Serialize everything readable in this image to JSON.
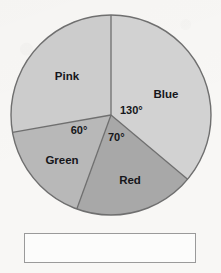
{
  "chart_data": {
    "type": "pie",
    "title": "",
    "categories": [
      "Blue",
      "Red",
      "Green",
      "Pink"
    ],
    "values": [
      130,
      70,
      60,
      100
    ],
    "value_unit": "degrees",
    "total_degrees": 360,
    "start_angle_deg": 0,
    "direction": "clockwise",
    "labels_shown": [
      "Blue",
      "Red",
      "Green",
      "Pink"
    ],
    "angle_annotations": [
      "130°",
      "70°",
      "60°"
    ],
    "unlabeled_slices": [
      "Pink"
    ],
    "legend": "none",
    "grid": false,
    "slices": [
      {
        "name": "Blue",
        "label": "Blue",
        "angle_deg": 130,
        "angle_label": "130°",
        "start_deg": 0,
        "end_deg": 130,
        "color": "#d2d2d2"
      },
      {
        "name": "Red",
        "label": "Red",
        "angle_deg": 70,
        "angle_label": "70°",
        "start_deg": 130,
        "end_deg": 200,
        "color": "#a8a8a8"
      },
      {
        "name": "Green",
        "label": "Green",
        "angle_deg": 60,
        "angle_label": "60°",
        "start_deg": 200,
        "end_deg": 260,
        "color": "#b8b8b8"
      },
      {
        "name": "Pink",
        "label": "Pink",
        "angle_deg": 100,
        "angle_label": "",
        "start_deg": 260,
        "end_deg": 360,
        "color": "#cccccc"
      }
    ]
  },
  "chart": {
    "center_x": 111,
    "center_y": 115,
    "radius": 100,
    "outline_color": "#6f6f6f",
    "label_color": "#16161a",
    "label_positions": {
      "blue": {
        "x": 166,
        "y": 98
      },
      "red": {
        "x": 130,
        "y": 184
      },
      "green": {
        "x": 62,
        "y": 164
      },
      "pink": {
        "x": 67,
        "y": 80
      }
    },
    "angle_label_positions": {
      "a130": {
        "x": 120,
        "y": 114
      },
      "a70": {
        "x": 108,
        "y": 141
      },
      "a60": {
        "x": 79,
        "y": 134
      }
    }
  },
  "answer_box": {
    "value": "",
    "placeholder": ""
  }
}
